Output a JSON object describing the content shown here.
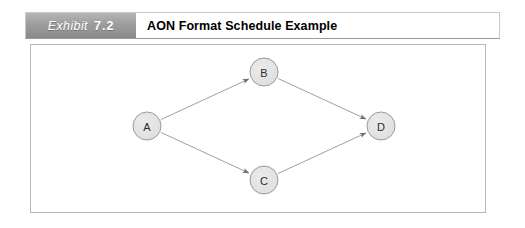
{
  "exhibit": {
    "tag_word": "Exhibit",
    "tag_number": "7.2",
    "title": "AON Format Schedule Example"
  },
  "colors": {
    "tag_gradient_top": "#b6b6b6",
    "tag_gradient_bottom": "#8a8a8a",
    "panel_border": "#b9b9b9",
    "node_fill": "#e3e3e3",
    "node_stroke": "#9b9b9b",
    "edge_stroke": "#a0a0a0",
    "arrow_fill": "#6e6e6e",
    "label_text": "#2b2b2b"
  },
  "diagram": {
    "type": "activity-on-node-network",
    "nodes": [
      {
        "id": "A",
        "label": "A",
        "cx": 147,
        "cy": 126,
        "r": 14
      },
      {
        "id": "B",
        "label": "B",
        "cx": 264,
        "cy": 72,
        "r": 14
      },
      {
        "id": "C",
        "label": "C",
        "cx": 264,
        "cy": 180,
        "r": 14
      },
      {
        "id": "D",
        "label": "D",
        "cx": 381,
        "cy": 126,
        "r": 14
      }
    ],
    "edges": [
      {
        "id": "a-to-b",
        "from": "A",
        "to": "B"
      },
      {
        "id": "a-to-c",
        "from": "A",
        "to": "C"
      },
      {
        "id": "b-to-d",
        "from": "B",
        "to": "D"
      },
      {
        "id": "c-to-d",
        "from": "C",
        "to": "D"
      }
    ]
  }
}
